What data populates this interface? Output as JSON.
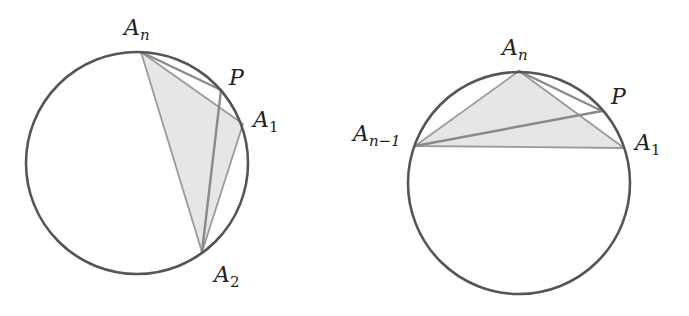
{
  "colors": {
    "circle": "#555555",
    "triangle_fill": "#e6e6e6",
    "triangle_edge": "#9a9a9a",
    "p_lines": "#8a8a8a",
    "text": "#222222"
  },
  "figures": [
    {
      "id": "left",
      "circle": {
        "cx": 137,
        "cy": 163,
        "r": 111
      },
      "points": {
        "An": [
          141,
          52
        ],
        "P": [
          221,
          90
        ],
        "A1": [
          243,
          124
        ],
        "A2": [
          202,
          252
        ]
      },
      "shaded_triangle": [
        "An",
        "A1",
        "A2"
      ],
      "p_segments": [
        [
          "P",
          "An"
        ],
        [
          "P",
          "A2"
        ]
      ],
      "labels": [
        {
          "name": "An",
          "base": "A",
          "sub": "n",
          "x": 124,
          "y": 35
        },
        {
          "name": "P",
          "base": "P",
          "sub": "",
          "x": 229,
          "y": 85
        },
        {
          "name": "A1",
          "base": "A",
          "sub": "1",
          "x": 253,
          "y": 127
        },
        {
          "name": "A2",
          "base": "A",
          "sub": "2",
          "x": 214,
          "y": 282
        }
      ]
    },
    {
      "id": "right",
      "circle": {
        "cx": 519,
        "cy": 183,
        "r": 111
      },
      "points": {
        "An": [
          519,
          71
        ],
        "P": [
          602,
          111
        ],
        "A1": [
          624,
          148
        ],
        "An-1": [
          415,
          146
        ]
      },
      "shaded_triangle": [
        "An",
        "A1",
        "An-1"
      ],
      "p_segments": [
        [
          "P",
          "An"
        ],
        [
          "P",
          "An-1"
        ]
      ],
      "labels": [
        {
          "name": "An",
          "base": "A",
          "sub": "n",
          "x": 502,
          "y": 55
        },
        {
          "name": "P",
          "base": "P",
          "sub": "",
          "x": 611,
          "y": 104
        },
        {
          "name": "A1",
          "base": "A",
          "sub": "1",
          "x": 635,
          "y": 150
        },
        {
          "name": "An-1",
          "base": "A",
          "sub": "n−1",
          "x": 353,
          "y": 141
        }
      ]
    }
  ]
}
